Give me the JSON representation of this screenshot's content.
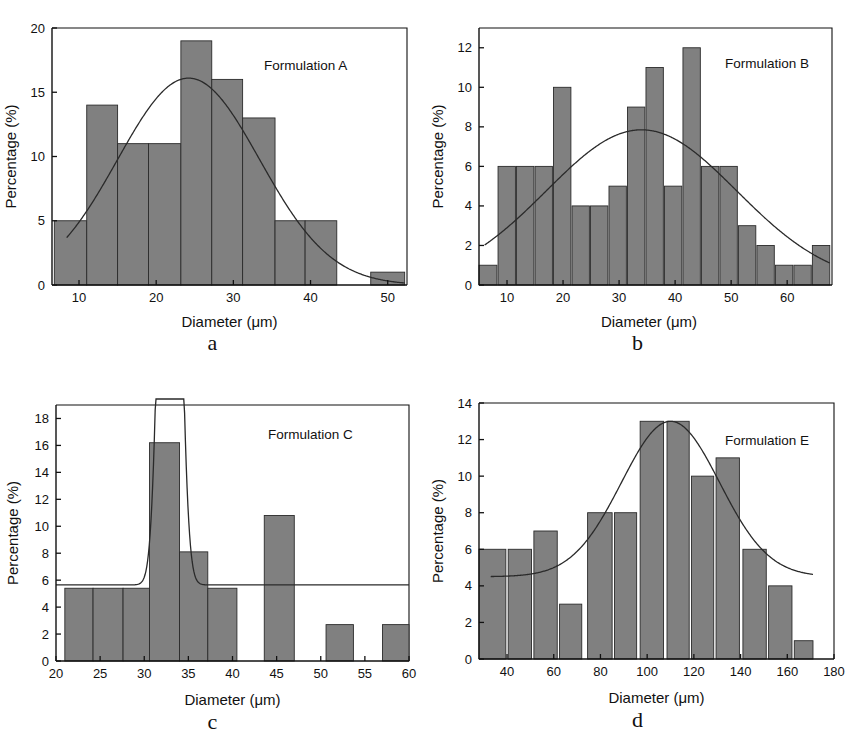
{
  "figure": {
    "kind": "four-panel-histogram-figure",
    "background": "#ffffff",
    "bar_color": "#808080",
    "curve_color": "#2a2a2a",
    "axis_color": "#111111"
  },
  "panels": [
    {
      "caption": "a",
      "series_label": "Formulation A"
    },
    {
      "caption": "b",
      "series_label": "Formulation B"
    },
    {
      "caption": "c",
      "series_label": "Formulation C"
    },
    {
      "caption": "d",
      "series_label": "Formulation E"
    }
  ],
  "chart_data": [
    {
      "type": "bar",
      "panel": "a",
      "title": "Formulation A",
      "xlabel": "Diameter (μm)",
      "ylabel": "Percentage (%)",
      "xlim": [
        6.5,
        52.5
      ],
      "ylim": [
        0,
        20
      ],
      "xticks": [
        10,
        20,
        30,
        40,
        50
      ],
      "yticks": [
        0,
        5,
        10,
        15,
        20
      ],
      "grid": false,
      "legend": "none",
      "bins": [
        {
          "x0": 6.8,
          "x1": 11.0,
          "value": 5
        },
        {
          "x0": 11.0,
          "x1": 15.0,
          "value": 14
        },
        {
          "x0": 15.0,
          "x1": 19.0,
          "value": 11
        },
        {
          "x0": 19.0,
          "x1": 23.2,
          "value": 11
        },
        {
          "x0": 23.2,
          "x1": 27.2,
          "value": 19
        },
        {
          "x0": 27.2,
          "x1": 31.2,
          "value": 16
        },
        {
          "x0": 31.2,
          "x1": 35.4,
          "value": 13
        },
        {
          "x0": 35.4,
          "x1": 39.3,
          "value": 5
        },
        {
          "x0": 39.3,
          "x1": 43.4,
          "value": 5
        },
        {
          "x0": 47.8,
          "x1": 52.2,
          "value": 1
        }
      ],
      "fit_curve": {
        "kind": "gaussian",
        "peak_value": 16.1,
        "peak_x": 24.2,
        "sigma": 9.2,
        "x_start": 8.4,
        "x_end": 52.2
      }
    },
    {
      "type": "bar",
      "panel": "b",
      "title": "Formulation B",
      "xlabel": "Diameter (μm)",
      "ylabel": "Percentage (%)",
      "xlim": [
        5.0,
        68.0
      ],
      "ylim": [
        0,
        13
      ],
      "xticks": [
        10,
        20,
        30,
        40,
        50,
        60
      ],
      "yticks": [
        0,
        2,
        4,
        6,
        8,
        10,
        12
      ],
      "grid": false,
      "legend": "none",
      "bins": [
        {
          "x0": 5.0,
          "x1": 8.2,
          "value": 1
        },
        {
          "x0": 8.4,
          "x1": 11.5,
          "value": 6
        },
        {
          "x0": 11.7,
          "x1": 14.8,
          "value": 6
        },
        {
          "x0": 15.0,
          "x1": 18.1,
          "value": 6
        },
        {
          "x0": 18.3,
          "x1": 21.4,
          "value": 10
        },
        {
          "x0": 21.6,
          "x1": 24.7,
          "value": 4
        },
        {
          "x0": 24.9,
          "x1": 28.0,
          "value": 4
        },
        {
          "x0": 28.2,
          "x1": 31.3,
          "value": 5
        },
        {
          "x0": 31.5,
          "x1": 34.6,
          "value": 9
        },
        {
          "x0": 34.8,
          "x1": 37.9,
          "value": 11
        },
        {
          "x0": 38.1,
          "x1": 41.2,
          "value": 5
        },
        {
          "x0": 41.4,
          "x1": 44.5,
          "value": 12
        },
        {
          "x0": 44.7,
          "x1": 47.8,
          "value": 6
        },
        {
          "x0": 48.0,
          "x1": 51.1,
          "value": 6
        },
        {
          "x0": 51.3,
          "x1": 54.4,
          "value": 3
        },
        {
          "x0": 54.6,
          "x1": 57.7,
          "value": 2
        },
        {
          "x0": 57.9,
          "x1": 61.0,
          "value": 1
        },
        {
          "x0": 61.2,
          "x1": 64.3,
          "value": 1
        },
        {
          "x0": 64.5,
          "x1": 67.6,
          "value": 2
        }
      ],
      "fit_curve": {
        "kind": "gaussian",
        "peak_value": 7.85,
        "peak_x": 34.0,
        "sigma": 17.0,
        "x_start": 6.0,
        "x_end": 67.6
      }
    },
    {
      "type": "bar",
      "panel": "c",
      "title": "Formulation C",
      "xlabel": "Diameter (μm)",
      "ylabel": "Percentage (%)",
      "xlim": [
        20,
        60
      ],
      "ylim": [
        0,
        19
      ],
      "xticks": [
        20,
        25,
        30,
        35,
        40,
        45,
        50,
        55,
        60
      ],
      "yticks": [
        0,
        2,
        4,
        6,
        8,
        10,
        12,
        14,
        16,
        18
      ],
      "grid": false,
      "legend": "none",
      "bins": [
        {
          "x0": 21.0,
          "x1": 24.2,
          "value": 5.4
        },
        {
          "x0": 24.2,
          "x1": 27.6,
          "value": 5.4
        },
        {
          "x0": 27.6,
          "x1": 30.6,
          "value": 5.4
        },
        {
          "x0": 30.6,
          "x1": 34.0,
          "value": 16.2
        },
        {
          "x0": 34.0,
          "x1": 37.2,
          "value": 8.1
        },
        {
          "x0": 37.2,
          "x1": 40.5,
          "value": 5.4
        },
        {
          "x0": 43.6,
          "x1": 47.0,
          "value": 10.8
        },
        {
          "x0": 50.6,
          "x1": 53.7,
          "value": 2.7
        },
        {
          "x0": 57.0,
          "x1": 60.0,
          "value": 2.7
        }
      ],
      "fit_curve": {
        "kind": "narrow-spike",
        "baseline_value": 5.65,
        "spike_x": 32.9,
        "spike_clipped_top": true,
        "x_start": 20.0,
        "x_end": 60.0
      }
    },
    {
      "type": "bar",
      "panel": "d",
      "title": "Formulation E",
      "xlabel": "Diameter (μm)",
      "ylabel": "Percentage (%)",
      "xlim": [
        28,
        180
      ],
      "ylim": [
        0,
        14
      ],
      "xticks": [
        40,
        60,
        80,
        100,
        120,
        140,
        160,
        180
      ],
      "yticks": [
        0,
        2,
        4,
        6,
        8,
        10,
        12,
        14
      ],
      "grid": false,
      "legend": "none",
      "bins": [
        {
          "x0": 28.0,
          "x1": 39.5,
          "value": 6
        },
        {
          "x0": 40.5,
          "x1": 50.5,
          "value": 6
        },
        {
          "x0": 51.5,
          "x1": 61.5,
          "value": 7
        },
        {
          "x0": 62.5,
          "x1": 72.0,
          "value": 3
        },
        {
          "x0": 74.5,
          "x1": 85.0,
          "value": 8
        },
        {
          "x0": 86.0,
          "x1": 95.5,
          "value": 8
        },
        {
          "x0": 97.0,
          "x1": 107.0,
          "value": 13
        },
        {
          "x0": 108.5,
          "x1": 118.0,
          "value": 13
        },
        {
          "x0": 119.0,
          "x1": 128.5,
          "value": 10
        },
        {
          "x0": 129.5,
          "x1": 139.5,
          "value": 11
        },
        {
          "x0": 141.0,
          "x1": 151.0,
          "value": 6
        },
        {
          "x0": 152.0,
          "x1": 162.0,
          "value": 4
        },
        {
          "x0": 163.0,
          "x1": 171.0,
          "value": 1
        }
      ],
      "fit_curve": {
        "kind": "gaussian-with-baseline",
        "peak_value": 13.0,
        "peak_x": 110.0,
        "sigma": 21.0,
        "baseline_value": 4.5,
        "x_start": 33.0,
        "x_end": 171.0
      }
    }
  ]
}
